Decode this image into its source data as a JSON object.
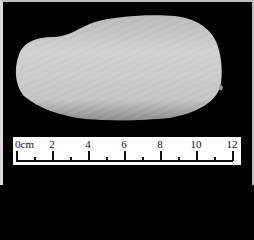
{
  "image": {
    "subject": "specimen-seed",
    "background_color": "#000000",
    "specimen_color": "#c8c8c8"
  },
  "ruler": {
    "unit_label": "0cm",
    "labels": [
      "0cm",
      "2",
      "4",
      "6",
      "8",
      "10",
      "12"
    ],
    "major_values": [
      0,
      2,
      4,
      6,
      8,
      10,
      12
    ],
    "minor_values": [
      1,
      3,
      5,
      7,
      9,
      11
    ],
    "px_per_cm": 18
  }
}
